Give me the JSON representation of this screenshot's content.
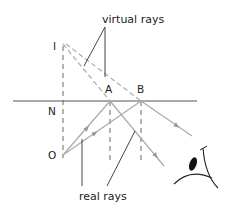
{
  "labels": {
    "virtual_rays": "virtual rays",
    "real_rays": "real rays",
    "I": "I",
    "N": "N",
    "O": "O",
    "A": "A",
    "B": "B"
  },
  "colors": {
    "mirror": "#555555",
    "ray": "#aaaaaa",
    "dashed": "#666666",
    "pointer": "#444444",
    "text": "#222222",
    "pupil": "#111111"
  }
}
